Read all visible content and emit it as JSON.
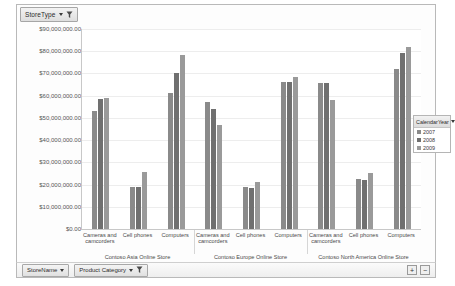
{
  "top_field_button": {
    "label": "StoreType",
    "caret_icon": "chevron-down-icon",
    "filter_icon": "funnel-filter-icon"
  },
  "bottom_field_buttons": [
    {
      "label": "StoreName",
      "caret_icon": "chevron-down-icon"
    },
    {
      "label": "Product Category",
      "caret_icon": "chevron-down-icon",
      "filter_icon": "funnel-filter-icon"
    }
  ],
  "zoom_controls": {
    "zoom_in_label": "+",
    "zoom_out_label": "−"
  },
  "legend": {
    "title": "CalendarYear",
    "dropdown_icon": "chevron-down-icon",
    "items": [
      {
        "label": "2007",
        "color": "#8a8a8a"
      },
      {
        "label": "2008",
        "color": "#707070"
      },
      {
        "label": "2009",
        "color": "#9a9a9a"
      }
    ]
  },
  "chart_data": {
    "type": "bar",
    "title": "",
    "xlabel": "",
    "ylabel": "",
    "ylim": [
      0,
      90000000
    ],
    "grid": true,
    "legend_position": "right",
    "y_ticks": [
      "$90,000,000.00",
      "$80,000,000.00",
      "$70,000,000.00",
      "$60,000,000.00",
      "$50,000,000.00",
      "$40,000,000.00",
      "$30,000,000.00",
      "$20,000,000.00",
      "$10,000,000.00",
      "$0.00"
    ],
    "categories": [
      "Cameras and camcorders",
      "Cell phones",
      "Computers",
      "Cameras and camcorders",
      "Cell phones",
      "Computers",
      "Cameras and camcorders",
      "Cell phones",
      "Computers"
    ],
    "groups": [
      {
        "label": "Contoso Asia Online Store",
        "categories": [
          0,
          1,
          2
        ]
      },
      {
        "label": "Contoso Europe Online Store",
        "categories": [
          3,
          4,
          5
        ]
      },
      {
        "label": "Contoso North America Online Store",
        "categories": [
          6,
          7,
          8
        ]
      }
    ],
    "series": [
      {
        "name": "2007",
        "color": "#8a8a8a",
        "values": [
          53000000,
          19000000,
          61000000,
          57000000,
          19000000,
          66000000,
          65500000,
          22500000,
          72000000
        ]
      },
      {
        "name": "2008",
        "color": "#707070",
        "values": [
          58500000,
          19000000,
          70000000,
          54000000,
          18500000,
          66000000,
          65500000,
          22000000,
          79000000
        ]
      },
      {
        "name": "2009",
        "color": "#9a9a9a",
        "values": [
          59000000,
          25500000,
          78500000,
          47000000,
          21000000,
          68500000,
          58000000,
          25000000,
          82000000
        ]
      }
    ]
  }
}
